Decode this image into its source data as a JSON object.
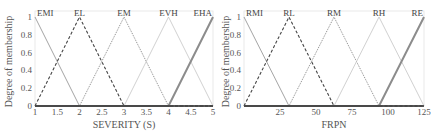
{
  "chart_data": [
    {
      "type": "line",
      "title": "",
      "xlabel": "SEVERITY (S)",
      "ylabel": "Degree of membership",
      "xlim": [
        1,
        5
      ],
      "ylim": [
        0,
        1
      ],
      "xticks": [
        "1",
        "1.5",
        "2",
        "2.5",
        "3",
        "3.5",
        "4",
        "4.5",
        "5"
      ],
      "xtick_values": [
        1,
        1.5,
        2,
        2.5,
        3,
        3.5,
        4,
        4.5,
        5
      ],
      "yticks": [
        "0",
        "0.2",
        "0.4",
        "0.6",
        "0.8",
        "1"
      ],
      "ytick_values": [
        0,
        0.2,
        0.4,
        0.6,
        0.8,
        1
      ],
      "grid": false,
      "series": [
        {
          "name": "EMI",
          "style": "solid",
          "color": "#9a9a9a",
          "x": [
            1,
            2,
            5
          ],
          "y": [
            1,
            0,
            0
          ]
        },
        {
          "name": "EL",
          "style": "dashed",
          "color": "#444444",
          "x": [
            1,
            2,
            3,
            5
          ],
          "y": [
            0,
            1,
            0,
            0
          ]
        },
        {
          "name": "EM",
          "style": "dotted",
          "color": "#8a8a8a",
          "x": [
            1,
            2,
            3,
            4,
            5
          ],
          "y": [
            0,
            0,
            1,
            0,
            0
          ]
        },
        {
          "name": "EVH",
          "style": "solid-thin",
          "color": "#c4c4c4",
          "x": [
            1,
            3,
            4,
            5
          ],
          "y": [
            0,
            0,
            1,
            0
          ]
        },
        {
          "name": "EHA",
          "style": "solid-thick",
          "color": "#8c8c8c",
          "x": [
            1,
            4,
            5
          ],
          "y": [
            0,
            0,
            1
          ]
        }
      ]
    },
    {
      "type": "line",
      "title": "",
      "xlabel": "FRPN",
      "ylabel": "Degree of membership",
      "xlim": [
        0,
        125
      ],
      "ylim": [
        0,
        1
      ],
      "xticks": [
        "25",
        "50",
        "75",
        "100",
        "125"
      ],
      "xtick_values": [
        25,
        50,
        75,
        100,
        125
      ],
      "yticks": [
        "0",
        "0.2",
        "0.4",
        "0.6",
        "0.8",
        "1"
      ],
      "ytick_values": [
        0,
        0.2,
        0.4,
        0.6,
        0.8,
        1
      ],
      "grid": false,
      "series": [
        {
          "name": "RMI",
          "style": "solid",
          "color": "#9a9a9a",
          "x": [
            0,
            31.25,
            125
          ],
          "y": [
            1,
            0,
            0
          ]
        },
        {
          "name": "RL",
          "style": "dashed",
          "color": "#444444",
          "x": [
            0,
            31.25,
            62.5,
            125
          ],
          "y": [
            0,
            1,
            0,
            0
          ]
        },
        {
          "name": "RM",
          "style": "dotted",
          "color": "#8a8a8a",
          "x": [
            0,
            31.25,
            62.5,
            93.75,
            125
          ],
          "y": [
            0,
            0,
            1,
            0,
            0
          ]
        },
        {
          "name": "RH",
          "style": "solid-thin",
          "color": "#c4c4c4",
          "x": [
            0,
            62.5,
            93.75,
            125
          ],
          "y": [
            0,
            0,
            1,
            0
          ]
        },
        {
          "name": "RE",
          "style": "solid-thick",
          "color": "#8c8c8c",
          "x": [
            0,
            93.75,
            125
          ],
          "y": [
            0,
            0,
            1
          ]
        }
      ]
    }
  ]
}
